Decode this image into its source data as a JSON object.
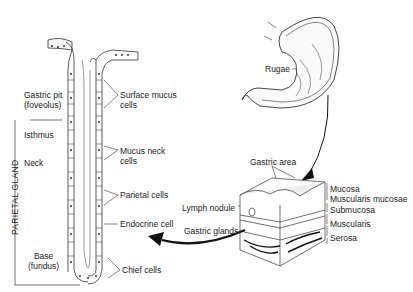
{
  "gland_labels": {
    "gastric_pit": "Gastric pit",
    "gastric_pit_sub": "(foveolus)",
    "isthmus": "Isthmus",
    "neck": "Neck",
    "base": "Base",
    "base_sub": "(fundus)",
    "parietal_gland": "PARIETAL GLAND"
  },
  "cell_labels": {
    "surface_mucus": "Surface mucus",
    "surface_mucus_sub": "cells",
    "mucus_neck": "Mucus neck",
    "mucus_neck_sub": "cells",
    "parietal": "Parietal cells",
    "endocrine": "Endocrine cell",
    "chief": "Chief cells"
  },
  "stomach_labels": {
    "rugae": "Rugae"
  },
  "wall_labels": {
    "gastric_area": "Gastric area",
    "lymph_nodule": "Lymph nodule",
    "gastric_glands": "Gastric glands",
    "mucosa": "Mucosa",
    "muscularis_mucosae": "Muscularis mucosae",
    "submucosa": "Submucosa",
    "muscularis": "Muscularis",
    "serosa": "Serosa"
  }
}
